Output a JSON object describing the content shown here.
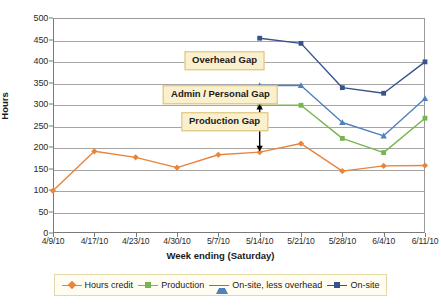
{
  "chart_data": {
    "type": "line",
    "title": "",
    "xlabel": "Week ending (Saturday)",
    "ylabel": "Hours",
    "categories": [
      "4/9/10",
      "4/17/10",
      "4/23/10",
      "4/30/10",
      "5/7/10",
      "5/14/10",
      "5/21/10",
      "5/28/10",
      "6/4/10",
      "6/11/10"
    ],
    "ylim": [
      0,
      500
    ],
    "ytick_step": 50,
    "yticks": [
      0,
      50,
      100,
      150,
      200,
      250,
      300,
      350,
      400,
      450,
      500
    ],
    "grid": true,
    "legend_position": "bottom",
    "series": [
      {
        "name": "Hours credit",
        "color": "#E8843C",
        "marker": "diamond",
        "values": [
          98,
          190,
          176,
          152,
          182,
          188,
          208,
          144,
          156,
          157
        ]
      },
      {
        "name": "Production",
        "color": "#76B64E",
        "marker": "square",
        "values": [
          null,
          null,
          null,
          null,
          null,
          297,
          297,
          220,
          187,
          267
        ]
      },
      {
        "name": "On-site, less overhead",
        "color": "#4F81BD",
        "marker": "triangle",
        "values": [
          null,
          null,
          null,
          null,
          null,
          343,
          343,
          257,
          226,
          313
        ]
      },
      {
        "name": "On-site",
        "color": "#36538C",
        "marker": "square",
        "values": [
          null,
          null,
          null,
          null,
          null,
          453,
          441,
          338,
          325,
          398
        ]
      }
    ],
    "annotations": [
      {
        "text": "Overhead Gap",
        "y_center": 400,
        "x_center_index": 4.15
      },
      {
        "text": "Admin / Personal Gap",
        "y_center": 322,
        "x_center_index": 4.05
      },
      {
        "text": "Production Gap",
        "y_center": 258,
        "x_center_index": 4.15
      }
    ],
    "arrow": {
      "label": "gap-measure-arrow",
      "x_index": 5.0,
      "y_top": 300,
      "y_bottom": 190,
      "color": "#000000",
      "double_headed": true
    }
  },
  "legend": {
    "items": [
      {
        "label": "Hours credit",
        "color": "#E8843C",
        "marker": "diamond"
      },
      {
        "label": "Production",
        "color": "#76B64E",
        "marker": "square"
      },
      {
        "label": "On-site, less overhead",
        "color": "#4F81BD",
        "marker": "triangle"
      },
      {
        "label": "On-site",
        "color": "#36538C",
        "marker": "square"
      }
    ]
  }
}
